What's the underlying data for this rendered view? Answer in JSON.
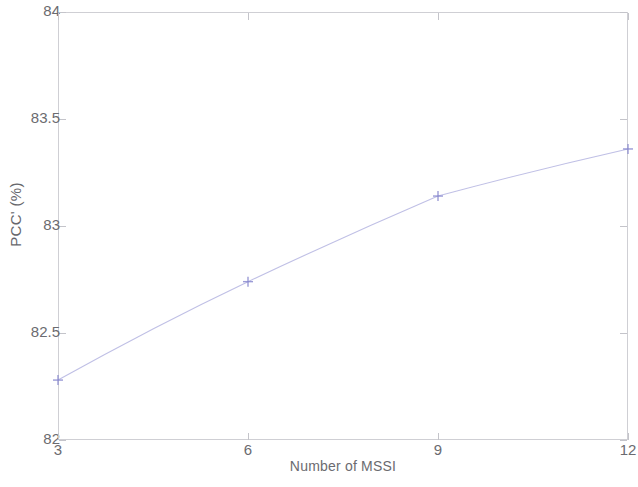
{
  "chart_data": {
    "type": "line",
    "title": "",
    "subtitle": "",
    "xlabel": "Number of MSSI",
    "ylabel": "PCC' (%)",
    "x": [
      3,
      6,
      9,
      12
    ],
    "values": [
      82.28,
      82.74,
      83.14,
      83.36
    ],
    "series": [
      {
        "name": "PCC'",
        "x": [
          3,
          6,
          9,
          12
        ],
        "values": [
          82.28,
          82.74,
          83.14,
          83.36
        ],
        "color": "#8a8ad0",
        "marker": "plus",
        "linestyle": "solid"
      }
    ],
    "xlim": [
      3,
      12
    ],
    "ylim": [
      82,
      84
    ],
    "xticks": [
      3,
      6,
      9,
      12
    ],
    "xtick_labels": [
      "3",
      "6",
      "9",
      "12"
    ],
    "yticks": [
      82,
      82.5,
      83,
      83.5,
      84
    ],
    "ytick_labels": [
      "82",
      "82.5",
      "83",
      "83.5",
      "84"
    ],
    "grid": false,
    "legend": null,
    "legend_position": "none",
    "annotations": [],
    "frame": true
  },
  "figure": {
    "background_color": "#ffffff",
    "axis_color": "#cfcfd4",
    "text_color": "#6b6b70",
    "line_color": "#8a8ad0"
  }
}
